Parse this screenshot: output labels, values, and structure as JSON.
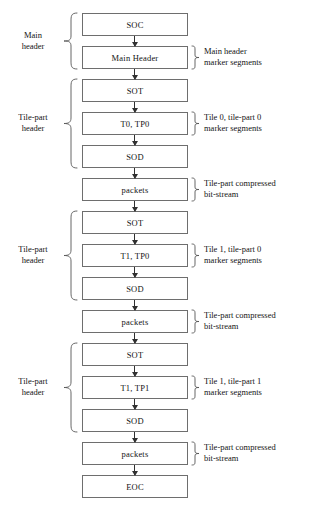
{
  "diagram": {
    "type": "flow-diagram",
    "boxes": [
      {
        "id": "soc",
        "label": "SOC"
      },
      {
        "id": "main-hdr",
        "label": "Main Header"
      },
      {
        "id": "sot-0",
        "label": "SOT"
      },
      {
        "id": "t0tp0",
        "label": "T0, TP0"
      },
      {
        "id": "sod-0",
        "label": "SOD"
      },
      {
        "id": "packets-0",
        "label": "packets"
      },
      {
        "id": "sot-1",
        "label": "SOT"
      },
      {
        "id": "t1tp0",
        "label": "T1, TP0"
      },
      {
        "id": "sod-1",
        "label": "SOD"
      },
      {
        "id": "packets-1",
        "label": "packets"
      },
      {
        "id": "sot-2",
        "label": "SOT"
      },
      {
        "id": "t1tp1",
        "label": "T1, TP1"
      },
      {
        "id": "sod-2",
        "label": "SOD"
      },
      {
        "id": "packets-2",
        "label": "packets"
      },
      {
        "id": "eoc",
        "label": "EOC"
      }
    ],
    "left_labels": [
      {
        "id": "main-header-label",
        "line1": "Main",
        "line2": "header"
      },
      {
        "id": "tile-part-header-0",
        "line1": "Tile-part",
        "line2": "header"
      },
      {
        "id": "tile-part-header-1",
        "line1": "Tile-part",
        "line2": "header"
      },
      {
        "id": "tile-part-header-2",
        "line1": "Tile-part",
        "line2": "header"
      }
    ],
    "right_labels": [
      {
        "id": "main-header-markers",
        "line1": "Main header",
        "line2": "marker segments"
      },
      {
        "id": "tile0-part0-markers",
        "line1": "Tile 0, tile-part 0",
        "line2": "marker segments"
      },
      {
        "id": "bitstream-0",
        "line1": "Tile-part compressed",
        "line2": "bit-stream"
      },
      {
        "id": "tile1-part0-markers",
        "line1": "Tile 1, tile-part 0",
        "line2": "marker segments"
      },
      {
        "id": "bitstream-1",
        "line1": "Tile-part compressed",
        "line2": "bit-stream"
      },
      {
        "id": "tile1-part1-markers",
        "line1": "Tile 1, tile-part 1",
        "line2": "marker segments"
      },
      {
        "id": "bitstream-2",
        "line1": "Tile-part compressed",
        "line2": "bit-stream"
      }
    ],
    "colors": {
      "box_border": "#6e6e6e",
      "box_fill": "#ffffff",
      "arrow": "#303030",
      "text": "#141414",
      "brace": "#555555",
      "background": "#ffffff"
    }
  }
}
